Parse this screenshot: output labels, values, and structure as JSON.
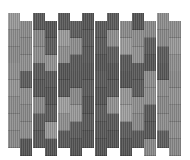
{
  "image": {
    "subject": "woven basket-weave pattern",
    "columns": [
      {
        "offset": "high",
        "shades": [
          "#9a9a9a",
          "#8e8e8e",
          "#8a8a8a",
          "#909090",
          "#959595",
          "#8c8c8c",
          "#8f8f8f",
          "#8a8a8a"
        ]
      },
      {
        "offset": "low",
        "shades": [
          "#8c8c8c",
          "#8a8a8a",
          "#909090",
          "#5e5e5e",
          "#909090",
          "#8a8a8a",
          "#8e8e8e",
          "#555555"
        ]
      },
      {
        "offset": "high",
        "shades": [
          "#5a5a5a",
          "#8a8a8a",
          "#8e8e8e",
          "#5c5c5c",
          "#585858",
          "#8a8a8a",
          "#5e5e5e",
          "#5a5a5a"
        ]
      },
      {
        "offset": "low",
        "shades": [
          "#555555",
          "#5e5e5e",
          "#939393",
          "#5a5a5a",
          "#565656",
          "#5c5c5c",
          "#9a9a9a",
          "#555555"
        ]
      },
      {
        "offset": "high",
        "shades": [
          "#5a5a5a",
          "#9c9c9c",
          "#8f8f8f",
          "#555555",
          "#585858",
          "#a0a0a0",
          "#8f8f8f",
          "#5a5a5a"
        ]
      },
      {
        "offset": "low",
        "shades": [
          "#5e5e5e",
          "#8e8e8e",
          "#5a5a5a",
          "#585858",
          "#8a8a8a",
          "#9a9a9a",
          "#5e5e5e",
          "#555555"
        ]
      },
      {
        "offset": "high",
        "shades": [
          "#555555",
          "#5c5c5c",
          "#5a5a5a",
          "#565656",
          "#5c5c5c",
          "#555555",
          "#5a5a5a",
          "#555555"
        ]
      },
      {
        "offset": "low",
        "shades": [
          "#5a5a5a",
          "#5c5c5c",
          "#555555",
          "#5a5a5a",
          "#565656",
          "#5e5e5e",
          "#585858",
          "#555555"
        ]
      },
      {
        "offset": "high",
        "shades": [
          "#5a5a5a",
          "#8f8f8f",
          "#5e5e5e",
          "#555555",
          "#5a5a5a",
          "#939393",
          "#5a5a5a",
          "#555555"
        ]
      },
      {
        "offset": "low",
        "shades": [
          "#8c8c8c",
          "#9c9c9c",
          "#5a5a5a",
          "#555555",
          "#989898",
          "#a0a0a0",
          "#5e5e5e",
          "#555555"
        ]
      },
      {
        "offset": "high",
        "shades": [
          "#555555",
          "#8e8e8e",
          "#939393",
          "#5a5a5a",
          "#5c5c5c",
          "#909090",
          "#8a8a8a",
          "#5a5a5a"
        ]
      },
      {
        "offset": "low",
        "shades": [
          "#8a8a8a",
          "#5e5e5e",
          "#555555",
          "#8e8e8e",
          "#909090",
          "#5a5a5a",
          "#585858",
          "#8a8a8a"
        ]
      },
      {
        "offset": "high",
        "shades": [
          "#8e8e8e",
          "#8a8a8a",
          "#5c5c5c",
          "#585858",
          "#8e8e8e",
          "#8a8a8a",
          "#8f8f8f",
          "#5e5e5e"
        ]
      },
      {
        "offset": "low",
        "shades": [
          "#8e8e8e",
          "#9a9a9a",
          "#8f8f8f",
          "#8a8a8a",
          "#939393",
          "#8c8c8c",
          "#909090",
          "#8a8a8a"
        ]
      }
    ]
  }
}
